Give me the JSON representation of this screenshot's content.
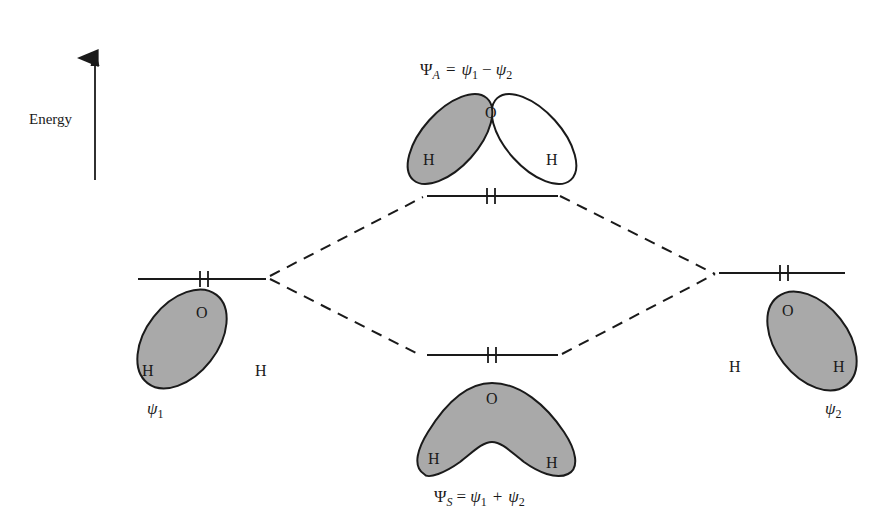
{
  "diagram": {
    "axis": {
      "label": "Energy",
      "arrow": {
        "x": 95,
        "y_top": 52,
        "y_bottom": 180
      }
    },
    "colors": {
      "line": "#1a1a1a",
      "lobe_fill": "#a9a9a9",
      "background": "#ffffff"
    },
    "levels": [
      {
        "id": "psi1",
        "x1": 138,
        "x2": 266,
        "y": 279,
        "electrons": 2
      },
      {
        "id": "psiA",
        "x1": 427,
        "x2": 558,
        "y": 196,
        "electrons": 2
      },
      {
        "id": "psiS",
        "x1": 427,
        "x2": 558,
        "y": 355,
        "electrons": 2
      },
      {
        "id": "psi2",
        "x1": 719,
        "x2": 845,
        "y": 273,
        "electrons": 2
      }
    ],
    "correlation_lines": [
      {
        "from": "psi1",
        "to": "psiA",
        "x1": 270,
        "y1": 276,
        "x2": 423,
        "y2": 197
      },
      {
        "from": "psi1",
        "to": "psiS",
        "x1": 270,
        "y1": 279,
        "x2": 418,
        "y2": 354
      },
      {
        "from": "psiA",
        "to": "psi2",
        "x1": 560,
        "y1": 196,
        "x2": 715,
        "y2": 274
      },
      {
        "from": "psiS",
        "to": "psi2",
        "x1": 562,
        "y1": 354,
        "x2": 715,
        "y2": 274
      }
    ],
    "orbitals": {
      "psi1": {
        "label_symbol": "ψ",
        "label_sub": "1",
        "atoms": {
          "O": "O",
          "H_in_lobe": "H",
          "H_free": "H"
        }
      },
      "psi2": {
        "label_symbol": "ψ",
        "label_sub": "2",
        "atoms": {
          "O": "O",
          "H_in_lobe": "H",
          "H_free": "H"
        }
      },
      "psiA": {
        "equation": {
          "lhs_symbol": "Ψ",
          "lhs_sub": "A",
          "op1": "=",
          "t1_symbol": "ψ",
          "t1_sub": "1",
          "op2": "−",
          "t2_symbol": "ψ",
          "t2_sub": "2"
        },
        "atoms": {
          "O": "O",
          "H_left": "H",
          "H_right": "H"
        }
      },
      "psiS": {
        "equation": {
          "lhs_symbol": "Ψ",
          "lhs_sub": "S",
          "op1": "=",
          "t1_symbol": "ψ",
          "t1_sub": "1",
          "op2": "+",
          "t2_symbol": "ψ",
          "t2_sub": "2"
        },
        "atoms": {
          "O": "O",
          "H_left": "H",
          "H_right": "H"
        }
      }
    }
  }
}
